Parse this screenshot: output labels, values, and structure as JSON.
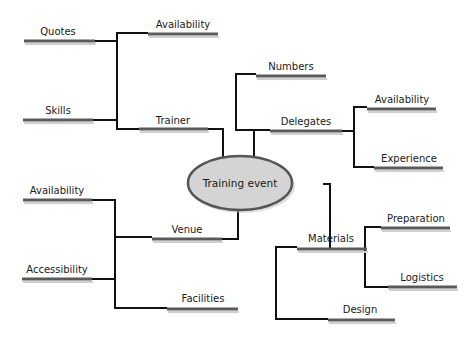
{
  "diagram": {
    "type": "mind-map",
    "center": {
      "label": "Training event",
      "fill": "#d4d4d4",
      "stroke": "#555555"
    },
    "branches": [
      {
        "label": "Trainer",
        "children": [
          {
            "label": "Availability"
          },
          {
            "label": "Quotes"
          },
          {
            "label": "Skills"
          }
        ]
      },
      {
        "label": "Delegates",
        "children": [
          {
            "label": "Numbers"
          },
          {
            "label": "Availability"
          },
          {
            "label": "Experience"
          }
        ]
      },
      {
        "label": "Venue",
        "children": [
          {
            "label": "Availability"
          },
          {
            "label": "Accessibility"
          },
          {
            "label": "Facilities"
          }
        ]
      },
      {
        "label": "Materials",
        "children": [
          {
            "label": "Preparation"
          },
          {
            "label": "Logistics"
          },
          {
            "label": "Design"
          }
        ]
      }
    ]
  },
  "colors": {
    "line": "#111111",
    "bar": "#5a5a5a",
    "oval_fill": "#d4d4d4",
    "text": "#1a1a1a"
  }
}
